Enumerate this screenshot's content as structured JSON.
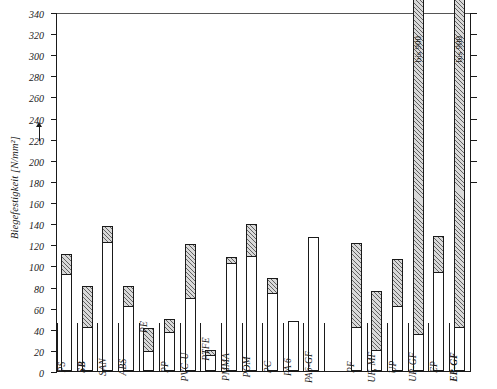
{
  "figure": {
    "y_axis_title": "Biegefestigkeit [N/mm²]",
    "arrow": "up-arrow"
  },
  "chart_data": {
    "type": "bar",
    "title": "",
    "xlabel": "",
    "ylabel": "Biegefestigkeit [N/mm²]",
    "ylim": [
      0,
      340
    ],
    "ytick_step": 20,
    "yticks": [
      0,
      20,
      40,
      60,
      80,
      100,
      120,
      140,
      160,
      180,
      200,
      220,
      240,
      260,
      280,
      300,
      320,
      340
    ],
    "ytick_labels": [
      "0",
      "20",
      "40",
      "60",
      "80",
      "100",
      "120",
      "140",
      "160",
      "180",
      "200",
      "220",
      "240",
      "260",
      "280",
      "300",
      "320",
      "340"
    ],
    "grid": false,
    "legend": "none",
    "note": "Each bar shows a range: plain lower part = minimum, hatched upper part = spread up to maximum",
    "categories": [
      "PS",
      "SB",
      "SAN",
      "ABS",
      "PE",
      "PP",
      "PVC-U",
      "PTFE",
      "PMMA",
      "POM",
      "PC",
      "PA 6",
      "PA6-GF",
      "PF",
      "UF, MF",
      "UP",
      "UP-GF",
      "EP",
      "EP-GF"
    ],
    "series": [
      {
        "name": "minimum",
        "values": [
          90,
          40,
          120,
          60,
          17,
          35,
          67,
          13,
          100,
          107,
          72,
          0,
          0,
          40,
          18,
          60,
          33,
          92,
          40
        ]
      },
      {
        "name": "maximum",
        "values": [
          110,
          80,
          136,
          80,
          40,
          48,
          119,
          19,
          107,
          138,
          87,
          47,
          127,
          120,
          75,
          105,
          340,
          127,
          340
        ]
      }
    ],
    "bars": [
      {
        "label": "PS",
        "min": 90,
        "max": 110,
        "hatched": true,
        "bold": false,
        "label_outside": false,
        "clipped": false,
        "overlabel": null
      },
      {
        "label": "SB",
        "min": 40,
        "max": 80,
        "hatched": true,
        "bold": true,
        "label_outside": false,
        "clipped": false,
        "overlabel": null
      },
      {
        "label": "SAN",
        "min": 120,
        "max": 136,
        "hatched": true,
        "bold": false,
        "label_outside": false,
        "clipped": false,
        "overlabel": null
      },
      {
        "label": "ABS",
        "min": 60,
        "max": 80,
        "hatched": true,
        "bold": false,
        "label_outside": false,
        "clipped": false,
        "overlabel": null
      },
      {
        "label": "PE",
        "min": 17,
        "max": 40,
        "hatched": true,
        "bold": false,
        "label_outside": true,
        "clipped": false,
        "overlabel": null
      },
      {
        "label": "PP",
        "min": 35,
        "max": 48,
        "hatched": true,
        "bold": false,
        "label_outside": false,
        "clipped": false,
        "overlabel": null
      },
      {
        "label": "PVC-U",
        "min": 67,
        "max": 119,
        "hatched": true,
        "bold": false,
        "label_outside": false,
        "clipped": false,
        "overlabel": null
      },
      {
        "label": "PTFE",
        "min": 13,
        "max": 19,
        "hatched": true,
        "bold": false,
        "label_outside": true,
        "clipped": false,
        "overlabel": null
      },
      {
        "label": "PMMA",
        "min": 100,
        "max": 107,
        "hatched": true,
        "bold": false,
        "label_outside": false,
        "clipped": false,
        "overlabel": null
      },
      {
        "label": "POM",
        "min": 107,
        "max": 138,
        "hatched": true,
        "bold": false,
        "label_outside": false,
        "clipped": false,
        "overlabel": null
      },
      {
        "label": "PC",
        "min": 72,
        "max": 87,
        "hatched": true,
        "bold": false,
        "label_outside": false,
        "clipped": false,
        "overlabel": null
      },
      {
        "label": "PA 6",
        "min": 0,
        "max": 47,
        "hatched": false,
        "bold": false,
        "label_outside": false,
        "clipped": false,
        "overlabel": null
      },
      {
        "label": "PA6-GF",
        "min": 0,
        "max": 127,
        "hatched": false,
        "bold": false,
        "label_outside": false,
        "clipped": false,
        "overlabel": null
      },
      {
        "label": "PF",
        "min": 40,
        "max": 120,
        "hatched": true,
        "bold": false,
        "label_outside": false,
        "clipped": false,
        "overlabel": null
      },
      {
        "label": "UF, MF",
        "min": 18,
        "max": 75,
        "hatched": true,
        "bold": false,
        "label_outside": false,
        "clipped": false,
        "overlabel": null
      },
      {
        "label": "UP",
        "min": 60,
        "max": 105,
        "hatched": true,
        "bold": false,
        "label_outside": false,
        "clipped": false,
        "overlabel": null
      },
      {
        "label": "UP-GF",
        "min": 33,
        "max": 340,
        "hatched": true,
        "bold": false,
        "label_outside": false,
        "clipped": true,
        "overlabel": "bis 900"
      },
      {
        "label": "EP",
        "min": 92,
        "max": 127,
        "hatched": true,
        "bold": false,
        "label_outside": false,
        "clipped": false,
        "overlabel": null
      },
      {
        "label": "EP-GF",
        "min": 40,
        "max": 340,
        "hatched": true,
        "bold": true,
        "label_outside": false,
        "clipped": true,
        "overlabel": "bis 900"
      }
    ],
    "annotations": [
      "bis 900",
      "bis 900"
    ]
  }
}
